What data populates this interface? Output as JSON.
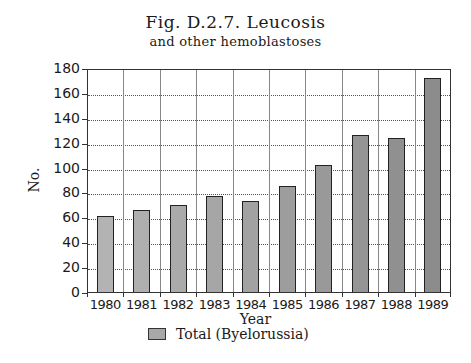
{
  "chart_data": {
    "type": "bar",
    "title": "Fig. D.2.7. Leucosis",
    "subtitle": "and other hemoblastoses",
    "xlabel": "Year",
    "ylabel": "No.",
    "categories": [
      "1980",
      "1981",
      "1982",
      "1983",
      "1984",
      "1985",
      "1986",
      "1987",
      "1988",
      "1989"
    ],
    "series": [
      {
        "name": "Total (Byelorussia)",
        "values": [
          61,
          66,
          70,
          77,
          73,
          85,
          102,
          126,
          124,
          172
        ]
      }
    ],
    "ylim": [
      0,
      180
    ],
    "yticks": [
      "0",
      "20",
      "40",
      "60",
      "80",
      "100",
      "120",
      "140",
      "160",
      "180"
    ],
    "grid": {
      "horizontal": "dotted",
      "vertical": "solid"
    },
    "legend_position": "bottom"
  },
  "colors": {
    "bar_light": "#b3b3b3",
    "bar_dark": "#8c8c8c",
    "axis": "#333333"
  }
}
